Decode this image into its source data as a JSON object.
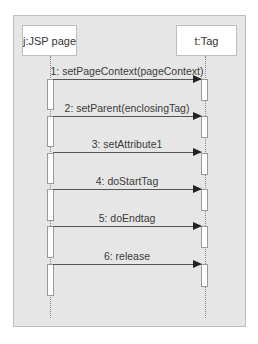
{
  "diagram": {
    "type": "sequence",
    "participants": [
      {
        "id": "jsp",
        "label": "j:JSP page"
      },
      {
        "id": "tag",
        "label": "t:Tag"
      }
    ],
    "messages": [
      {
        "order": 1,
        "label": "1: setPageContext(pageContext)",
        "from": "j:JSP page",
        "to": "t:Tag"
      },
      {
        "order": 2,
        "label": "2: setParent(enclosingTag)",
        "from": "j:JSP page",
        "to": "t:Tag"
      },
      {
        "order": 3,
        "label": "3: setAttribute1",
        "from": "j:JSP page",
        "to": "t:Tag"
      },
      {
        "order": 4,
        "label": "4: doStartTag",
        "from": "j:JSP page",
        "to": "t:Tag"
      },
      {
        "order": 5,
        "label": "5: doEndtag",
        "from": "j:JSP page",
        "to": "t:Tag"
      },
      {
        "order": 6,
        "label": "6: release",
        "from": "j:JSP page",
        "to": "t:Tag"
      }
    ],
    "colors": {
      "panel_bg": "#e6e6e6",
      "box_bg": "#ffffff",
      "border": "#bdbdbd",
      "arrow": "#222222"
    }
  }
}
